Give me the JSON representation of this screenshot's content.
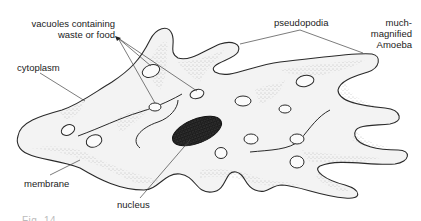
{
  "diagram": {
    "colors": {
      "outline": "#2a2a2a",
      "cytoplasm_fill": "#f2f2f2",
      "stipple": "#8a8a8a",
      "nucleus": "#1a1a1a",
      "leader_line": "#555555",
      "text": "#222222"
    },
    "labels": {
      "vacuoles_line1": "vacuoles containing",
      "vacuoles_line2": "waste or food",
      "cytoplasm": "cytoplasm",
      "pseudopodia": "pseudopodia",
      "title_line1": "much-",
      "title_line2": "magnified",
      "title_line3": "Amoeba",
      "membrane": "membrane",
      "nucleus": "nucleus"
    },
    "caption_partial": "Fig. 14 ..."
  }
}
